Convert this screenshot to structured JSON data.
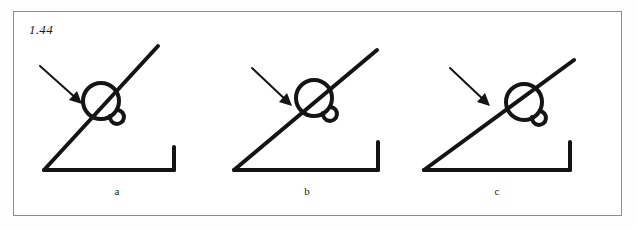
{
  "figure": {
    "number": "1.44",
    "border_color": "#8d8d8d",
    "ink_color": "#141414",
    "background_color": "#ffffff"
  },
  "panels": [
    {
      "label": "a",
      "description": "angle with steep diagonal ray, circle marker on ray, arrow pointing to circle",
      "angle_degrees": 52,
      "arrow": {
        "from_x": 18,
        "from_y": 36,
        "to_x": 60,
        "to_y": 74
      },
      "vertex": {
        "x": 22,
        "y": 140
      },
      "ray_tip": {
        "x": 136,
        "y": 16
      },
      "baseline_end": {
        "x": 152,
        "y": 140
      },
      "tick_top": {
        "x": 152,
        "y": 117
      },
      "circle": {
        "cx": 79,
        "cy": 71,
        "r": 18
      },
      "hook": {
        "cx": 92,
        "cy": 87,
        "r": 7
      }
    },
    {
      "label": "b",
      "description": "angle with medium diagonal ray, circle marker on ray, arrow pointing to circle",
      "angle_degrees": 40,
      "arrow": {
        "from_x": 40,
        "from_y": 38,
        "to_x": 80,
        "to_y": 76
      },
      "vertex": {
        "x": 22,
        "y": 140
      },
      "ray_tip": {
        "x": 165,
        "y": 20
      },
      "baseline_end": {
        "x": 166,
        "y": 140
      },
      "tick_top": {
        "x": 166,
        "y": 112
      },
      "circle": {
        "cx": 102,
        "cy": 68,
        "r": 18
      },
      "hook": {
        "cx": 115,
        "cy": 84,
        "r": 7
      }
    },
    {
      "label": "c",
      "description": "angle with shallow diagonal ray, circle marker on ray, arrow pointing to circle",
      "angle_degrees": 30,
      "arrow": {
        "from_x": 48,
        "from_y": 38,
        "to_x": 88,
        "to_y": 76
      },
      "vertex": {
        "x": 22,
        "y": 140
      },
      "ray_tip": {
        "x": 172,
        "y": 30
      },
      "baseline_end": {
        "x": 168,
        "y": 140
      },
      "tick_top": {
        "x": 168,
        "y": 112
      },
      "circle": {
        "cx": 122,
        "cy": 72,
        "r": 18
      },
      "hook": {
        "cx": 134,
        "cy": 88,
        "r": 7
      }
    }
  ]
}
